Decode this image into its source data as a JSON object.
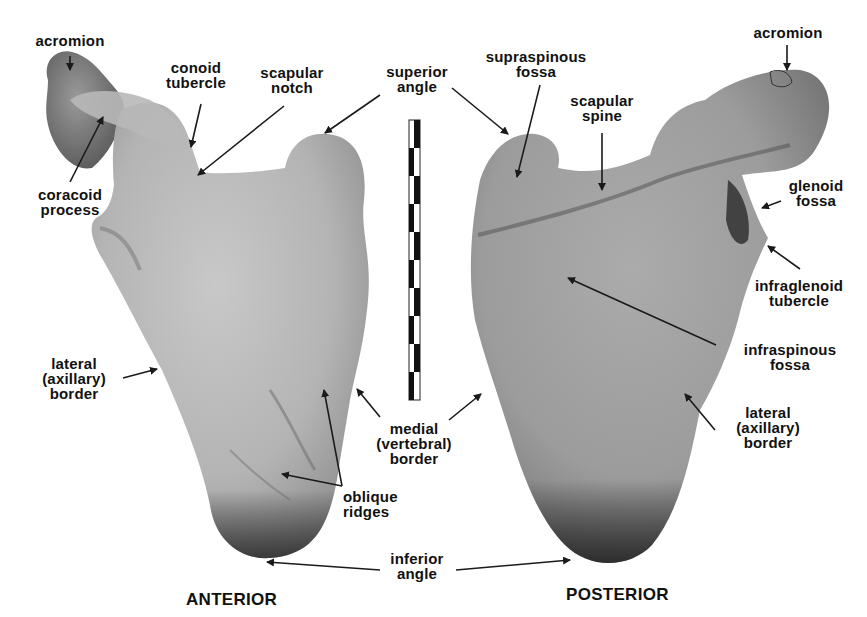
{
  "figure": {
    "views": {
      "anterior": "ANTERIOR",
      "posterior": "POSTERIOR"
    },
    "colors": {
      "background": "#ffffff",
      "bone_light": "#c2c2c2",
      "bone_mid": "#a9a9a9",
      "bone_dark": "#3a3a3a",
      "text": "#111111",
      "arrow": "#1a1a1a"
    },
    "scale_bar": {
      "segments": 10,
      "orientation": "vertical"
    },
    "anterior_labels": {
      "acromion": "acromion",
      "conoid_tubercle": "conoid\ntubercle",
      "scapular_notch": "scapular\nnotch",
      "coracoid_process": "coracoid\nprocess",
      "lateral_border": "lateral\n(axillary)\nborder",
      "oblique_ridges": "oblique\nridges"
    },
    "shared_labels": {
      "superior_angle": "superior\nangle",
      "medial_border": "medial\n(vertebral)\nborder",
      "inferior_angle": "inferior\nangle"
    },
    "posterior_labels": {
      "supraspinous_fossa": "supraspinous\nfossa",
      "scapular_spine": "scapular\nspine",
      "acromion": "acromion",
      "glenoid_fossa": "glenoid\nfossa",
      "infraglenoid_tubercle": "infraglenoid\ntubercle",
      "infraspinous_fossa": "infraspinous\nfossa",
      "lateral_border": "lateral\n(axillary)\nborder"
    }
  }
}
